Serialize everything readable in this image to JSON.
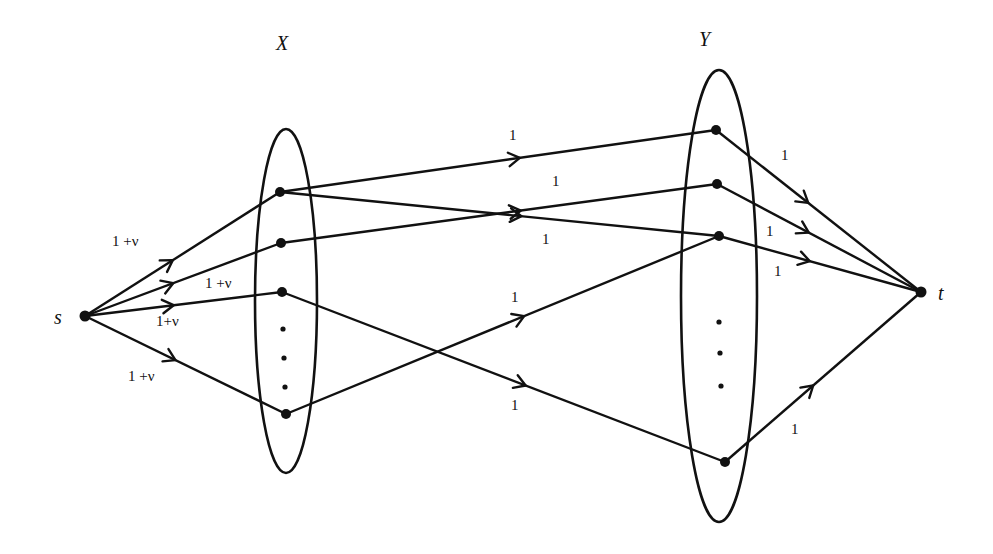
{
  "diagram": {
    "type": "flow-network",
    "set_labels": {
      "X": "X",
      "Y": "Y"
    },
    "terminal_labels": {
      "source": "s",
      "sink": "t"
    },
    "nodes": {
      "s": [
        85,
        316
      ],
      "t": [
        921,
        292
      ],
      "X": [
        [
          280,
          192
        ],
        [
          281,
          243
        ],
        [
          282,
          292
        ],
        [
          286,
          414
        ]
      ],
      "Y": [
        [
          716,
          130
        ],
        [
          717,
          184
        ],
        [
          719,
          236
        ],
        [
          725,
          462
        ]
      ],
      "X_dots": [
        [
          283,
          329
        ],
        [
          284,
          358
        ],
        [
          285,
          387
        ]
      ],
      "Y_dots": [
        [
          719,
          322
        ],
        [
          720,
          353
        ],
        [
          721,
          386
        ]
      ]
    },
    "ellipses": {
      "X": {
        "cx": 286,
        "cy": 301,
        "rx": 31,
        "ry": 172
      },
      "Y": {
        "cx": 719,
        "cy": 296,
        "rx": 38,
        "ry": 226
      }
    },
    "edges": [
      {
        "from": "s",
        "to": "X0",
        "capacity": "1 +ν",
        "label_pos": [
          112,
          246
        ]
      },
      {
        "from": "s",
        "to": "X1",
        "capacity": "1 +ν",
        "label_pos": [
          205,
          288
        ]
      },
      {
        "from": "s",
        "to": "X2",
        "capacity": "1+ν",
        "label_pos": [
          156,
          326
        ]
      },
      {
        "from": "s",
        "to": "X3",
        "capacity": "1 +ν",
        "label_pos": [
          128,
          381
        ]
      },
      {
        "from": "X0",
        "to": "Y0",
        "capacity": "1",
        "label_pos": [
          509,
          140
        ]
      },
      {
        "from": "X1",
        "to": "Y1",
        "capacity": "1",
        "label_pos": [
          552,
          186
        ]
      },
      {
        "from": "X0",
        "to": "Y2",
        "capacity": "1",
        "label_pos": [
          542,
          244
        ]
      },
      {
        "from": "X3",
        "to": "Y2",
        "capacity": "1",
        "label_pos": [
          511,
          302
        ]
      },
      {
        "from": "X2",
        "to": "Y3",
        "capacity": "1",
        "label_pos": [
          511,
          410
        ]
      },
      {
        "from": "Y0",
        "to": "t",
        "capacity": "1",
        "label_pos": [
          781,
          160
        ]
      },
      {
        "from": "Y1",
        "to": "t",
        "capacity": "1",
        "label_pos": [
          766,
          236
        ]
      },
      {
        "from": "Y2",
        "to": "t",
        "capacity": "1",
        "label_pos": [
          774,
          276
        ]
      },
      {
        "from": "Y3",
        "to": "t",
        "capacity": "1",
        "label_pos": [
          791,
          434
        ]
      }
    ]
  }
}
